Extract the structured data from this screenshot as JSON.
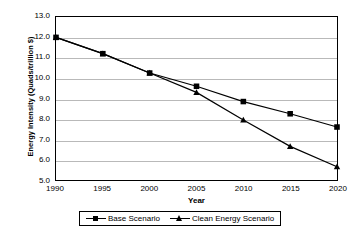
{
  "chart_data": {
    "type": "line",
    "title": "",
    "xlabel": "Year",
    "ylabel": "Energy Intensity (Quads/trillion $)",
    "x": [
      1990,
      1995,
      2000,
      2005,
      2010,
      2015,
      2020
    ],
    "xtick_labels": [
      "1990",
      "1995",
      "2000",
      "2005",
      "2010",
      "2015",
      "2020"
    ],
    "ytick_labels": [
      "13.0",
      "12.0",
      "11.0",
      "10.0",
      "9.0",
      "8.0",
      "7.0",
      "6.0",
      "5.0"
    ],
    "ytick_values": [
      13.0,
      12.0,
      11.0,
      10.0,
      9.0,
      8.0,
      7.0,
      6.0,
      5.0
    ],
    "ylim": [
      5.0,
      13.0
    ],
    "xlim": [
      1990,
      2020
    ],
    "grid": true,
    "grid_color": "#b9b9b9",
    "legend_position": "bottom",
    "series": [
      {
        "name": "Base Scenario",
        "marker": "square",
        "color": "#000000",
        "values": [
          12.0,
          11.2,
          10.25,
          9.6,
          8.85,
          8.25,
          7.6
        ]
      },
      {
        "name": "Clean Energy Scenario",
        "marker": "triangle",
        "color": "#000000",
        "values": [
          12.0,
          11.2,
          10.25,
          9.3,
          7.95,
          6.65,
          5.65
        ]
      }
    ]
  }
}
